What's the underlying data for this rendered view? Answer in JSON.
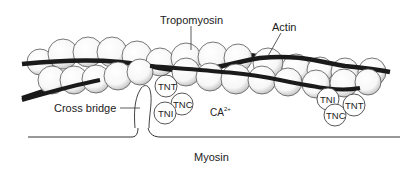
{
  "diagram": {
    "labels": {
      "tropomyosin": "Tropomyosin",
      "actin": "Actin",
      "cross_bridge": "Cross bridge",
      "calcium": "CA",
      "calcium_charge": "2+",
      "myosin": "Myosin"
    },
    "troponin_left": {
      "tnt": "TNT",
      "tnc": "TNC",
      "tni": "TNI"
    },
    "troponin_right": {
      "tni": "TNI",
      "tnc": "TNC",
      "tnt": "TNT"
    },
    "colors": {
      "line": "#1a1a1a",
      "sphere_fill": "#ffffff",
      "sphere_stroke": "#555555",
      "stipple": "#9a9a9a"
    }
  }
}
